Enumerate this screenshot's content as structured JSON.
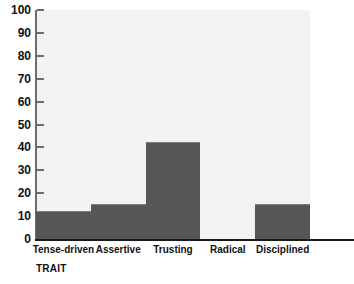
{
  "chart_data": {
    "type": "bar",
    "title": "",
    "subtitle": "",
    "xlabel": "TRAIT",
    "ylabel": "",
    "categories": [
      "Tense-driven",
      "Assertive",
      "Trusting",
      "Radical",
      "Disciplined"
    ],
    "values": [
      12,
      15,
      42,
      0,
      15
    ],
    "ylim": [
      0,
      100
    ],
    "ytick_labels": [
      "100",
      "90",
      "80",
      "70",
      "60",
      "50",
      "40",
      "30",
      "20",
      "10",
      "0"
    ],
    "ytick_values": [
      100,
      90,
      80,
      70,
      60,
      50,
      40,
      30,
      20,
      10,
      0
    ],
    "grid": false,
    "legend": false,
    "legend_position": "none",
    "bar_gap": 0,
    "colors": {
      "bar_fill": "#565656",
      "bar_edge": "#7d7d7d",
      "plot_background": "#f4f3f1",
      "page_background": "#ffffff",
      "axis_line": "#1a1a1a",
      "y_axis_line": "#6d6d6d",
      "tick_mark": "#6d6d6d",
      "text": "#111111"
    }
  }
}
